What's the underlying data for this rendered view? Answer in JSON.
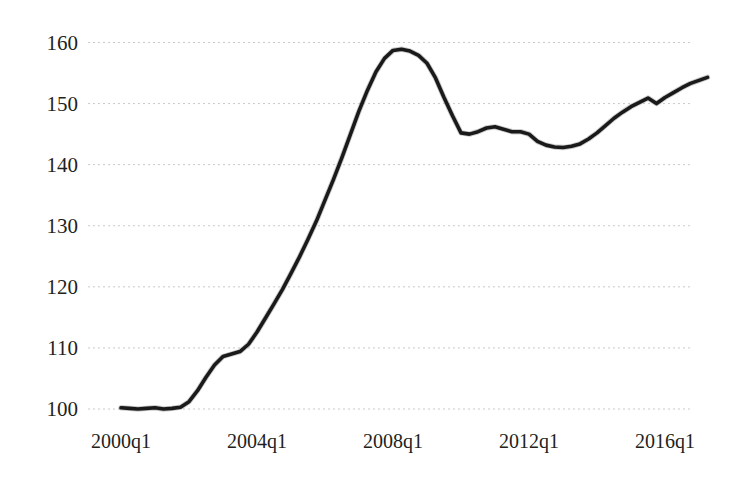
{
  "chart_data": {
    "type": "line",
    "title": "",
    "subtitle": "",
    "xlabel": "",
    "ylabel": "",
    "xlim": [
      "2000q1",
      "2017q2"
    ],
    "ylim": [
      100,
      160
    ],
    "yticks": [
      100,
      110,
      120,
      130,
      140,
      150,
      160
    ],
    "ytick_labels": [
      "100",
      "110",
      "120",
      "130",
      "140",
      "150",
      "160"
    ],
    "xticks": [
      "2000q1",
      "2004q1",
      "2008q1",
      "2012q1",
      "2016q1"
    ],
    "xtick_labels": [
      "2000q1",
      "2004q1",
      "2008q1",
      "2012q1",
      "2016q1"
    ],
    "grid": "horizontal-dotted",
    "legend": "none",
    "line_color": "#1a1a1a",
    "grid_color": "#c9c9c9",
    "background_color": "#ffffff",
    "series": [
      {
        "name": "index",
        "x": [
          "2000q1",
          "2000q2",
          "2000q3",
          "2000q4",
          "2001q1",
          "2001q2",
          "2001q3",
          "2001q4",
          "2002q1",
          "2002q2",
          "2002q3",
          "2002q4",
          "2003q1",
          "2003q2",
          "2003q3",
          "2003q4",
          "2004q1",
          "2004q2",
          "2004q3",
          "2004q4",
          "2005q1",
          "2005q2",
          "2005q3",
          "2005q4",
          "2006q1",
          "2006q2",
          "2006q3",
          "2006q4",
          "2007q1",
          "2007q2",
          "2007q3",
          "2007q4",
          "2008q1",
          "2008q2",
          "2008q3",
          "2008q4",
          "2009q1",
          "2009q2",
          "2009q3",
          "2009q4",
          "2010q1",
          "2010q2",
          "2010q3",
          "2010q4",
          "2011q1",
          "2011q2",
          "2011q3",
          "2011q4",
          "2012q1",
          "2012q2",
          "2012q3",
          "2012q4",
          "2013q1",
          "2013q2",
          "2013q3",
          "2013q4",
          "2014q1",
          "2014q2",
          "2014q3",
          "2014q4",
          "2015q1",
          "2015q2",
          "2015q3",
          "2015q4",
          "2016q1",
          "2016q2",
          "2016q3",
          "2016q4",
          "2017q1",
          "2017q2"
        ],
        "values": [
          100.2,
          100.1,
          100.0,
          100.1,
          100.2,
          100.0,
          100.1,
          100.3,
          101.2,
          103.0,
          105.2,
          107.2,
          108.6,
          109.0,
          109.4,
          110.6,
          112.6,
          114.9,
          117.2,
          119.6,
          122.2,
          124.9,
          127.8,
          130.8,
          134.2,
          137.6,
          141.2,
          145.0,
          148.8,
          152.2,
          155.2,
          157.4,
          158.7,
          158.9,
          158.6,
          157.9,
          156.6,
          154.2,
          151.0,
          148.0,
          145.2,
          145.0,
          145.4,
          146.0,
          146.2,
          145.8,
          145.4,
          145.4,
          145.0,
          143.8,
          143.2,
          142.9,
          142.8,
          143.0,
          143.4,
          144.2,
          145.2,
          146.4,
          147.6,
          148.6,
          149.5,
          150.2,
          150.9,
          150.0,
          151.0,
          151.8,
          152.6,
          153.3,
          153.8,
          154.3
        ]
      }
    ]
  },
  "axis": {
    "y_label_color": "#231f20",
    "x_label_color": "#231f20"
  }
}
